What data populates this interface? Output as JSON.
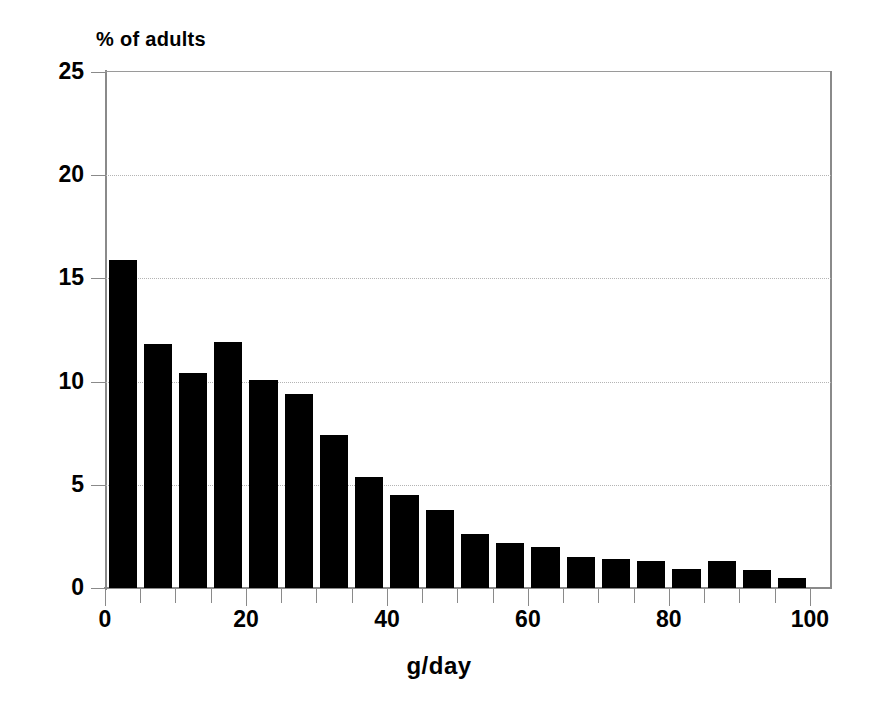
{
  "chart_data": {
    "type": "bar",
    "title": "",
    "subtitle": "",
    "ylabel": "% of adults",
    "xlabel": "g/day",
    "xlim": [
      0,
      103
    ],
    "ylim": [
      0,
      25
    ],
    "grid": true,
    "legend": null,
    "bar_width_units": 5,
    "x_tick_step": 5,
    "x_major_step": 20,
    "y_tick_step": 5,
    "categories": [
      "0-5",
      "5-10",
      "10-15",
      "15-20",
      "20-25",
      "25-30",
      "30-35",
      "35-40",
      "40-45",
      "45-50",
      "50-55",
      "55-60",
      "60-65",
      "65-70",
      "70-75",
      "75-80",
      "80-85",
      "85-90",
      "90-95",
      "95-100"
    ],
    "x_bin_starts": [
      0,
      5,
      10,
      15,
      20,
      25,
      30,
      35,
      40,
      45,
      50,
      55,
      60,
      65,
      70,
      75,
      80,
      85,
      90,
      95
    ],
    "values": [
      15.9,
      11.8,
      10.4,
      11.9,
      10.1,
      9.4,
      7.4,
      5.4,
      4.5,
      3.8,
      2.6,
      2.2,
      2.0,
      1.5,
      1.4,
      1.3,
      0.9,
      1.3,
      0.85,
      0.5
    ],
    "y_tick_labels": [
      "0",
      "5",
      "10",
      "15",
      "20",
      "25"
    ],
    "y_tick_values": [
      0,
      5,
      10,
      15,
      20,
      25
    ],
    "x_tick_labels": [
      "0",
      "20",
      "40",
      "60",
      "80",
      "100"
    ],
    "x_tick_values": [
      0,
      20,
      40,
      60,
      80,
      100
    ],
    "x_minor_tick_values": [
      0,
      5,
      10,
      15,
      20,
      25,
      30,
      35,
      40,
      45,
      50,
      55,
      60,
      65,
      70,
      75,
      80,
      85,
      90,
      95,
      100
    ],
    "colors": {
      "bar": "#000000",
      "axis": "#8a8a8a",
      "grid": "#b4b4b4",
      "text": "#000000",
      "background": "#ffffff"
    }
  }
}
